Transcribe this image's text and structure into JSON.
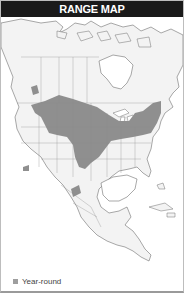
{
  "header": {
    "title": "RANGE MAP"
  },
  "map": {
    "region": "North America",
    "land_color": "#f2f2f2",
    "water_color": "#ffffff",
    "border_color": "#7a7a7a",
    "range_color": "#8f8f8f"
  },
  "legend": {
    "items": [
      {
        "label": "Year-round",
        "color": "#9e9e9e"
      }
    ]
  }
}
